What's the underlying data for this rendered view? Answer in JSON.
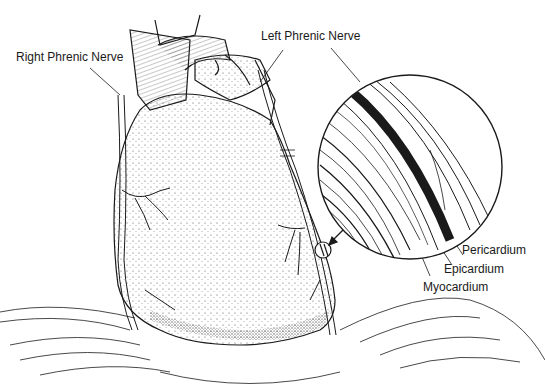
{
  "figure": {
    "labels": {
      "right_phrenic_nerve": "Right Phrenic Nerve",
      "left_phrenic_nerve": "Left Phrenic Nerve",
      "pericardium": "Pericardium",
      "epicardium": "Epicardium",
      "myocardium": "Myocardium"
    },
    "colors": {
      "ink": "#1a1a1a",
      "background": "#ffffff"
    }
  }
}
